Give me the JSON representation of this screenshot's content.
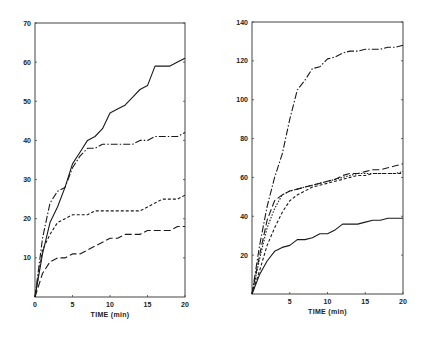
{
  "chart_data": [
    {
      "type": "line",
      "title": "",
      "xlabel": "TIME (min)",
      "ylabel": "",
      "xlim": [
        0,
        20
      ],
      "ylim": [
        0,
        70
      ],
      "x_ticks": [
        0,
        5,
        10,
        15,
        20
      ],
      "x_tick_labels": [
        "0",
        "5",
        "10",
        "15",
        "20"
      ],
      "y_ticks": [
        10,
        20,
        30,
        40,
        50,
        60,
        70
      ],
      "y_tick_labels": [
        "10",
        "20",
        "30",
        "40",
        "50",
        "60",
        "70"
      ],
      "grid": false,
      "legend": null,
      "series": [
        {
          "name": "solid",
          "style": "solid",
          "x": [
            0,
            1,
            2,
            3,
            4,
            5,
            6,
            7,
            8,
            9,
            10,
            11,
            12,
            13,
            14,
            15,
            16,
            17,
            18,
            19,
            20
          ],
          "y": [
            0,
            11,
            19,
            23,
            28,
            34,
            37,
            40,
            41,
            43,
            47,
            48,
            49,
            51,
            53,
            54,
            59,
            59,
            59,
            60,
            61
          ]
        },
        {
          "name": "dash-dot",
          "style": "dashdot",
          "x": [
            0,
            1,
            2,
            3,
            4,
            5,
            6,
            7,
            8,
            9,
            10,
            11,
            12,
            13,
            14,
            15,
            16,
            17,
            18,
            19,
            20
          ],
          "y": [
            0,
            15,
            24,
            27,
            28,
            33,
            36,
            38,
            38,
            39,
            39,
            39,
            39,
            39,
            40,
            40,
            41,
            41,
            41,
            41,
            42
          ]
        },
        {
          "name": "short-dash",
          "style": "shortdash",
          "x": [
            0,
            1,
            2,
            3,
            4,
            5,
            6,
            7,
            8,
            9,
            10,
            11,
            12,
            13,
            14,
            15,
            16,
            17,
            18,
            19,
            20
          ],
          "y": [
            0,
            12,
            16,
            19,
            20,
            21,
            21,
            21,
            22,
            22,
            22,
            22,
            22,
            22,
            22,
            23,
            24,
            25,
            25,
            25,
            26
          ]
        },
        {
          "name": "long-dash",
          "style": "longdash",
          "x": [
            0,
            1,
            2,
            3,
            4,
            5,
            6,
            7,
            8,
            9,
            10,
            11,
            12,
            13,
            14,
            15,
            16,
            17,
            18,
            19,
            20
          ],
          "y": [
            0,
            6,
            9,
            10,
            10,
            11,
            11,
            12,
            13,
            14,
            15,
            15,
            16,
            16,
            16,
            17,
            17,
            17,
            17,
            18,
            18
          ]
        }
      ]
    },
    {
      "type": "line",
      "title": "",
      "xlabel": "TIME (min)",
      "ylabel": "",
      "xlim": [
        0,
        20
      ],
      "ylim": [
        0,
        140
      ],
      "x_ticks": [
        5,
        10,
        15,
        20
      ],
      "x_tick_labels": [
        "5",
        "10",
        "15",
        "20"
      ],
      "y_ticks": [
        20,
        40,
        60,
        80,
        100,
        120,
        140
      ],
      "y_tick_labels": [
        "20",
        "40",
        "60",
        "80",
        "100",
        "120",
        "140"
      ],
      "grid": false,
      "legend": null,
      "series": [
        {
          "name": "dash-dot",
          "style": "dashdot",
          "x": [
            0,
            1,
            2,
            3,
            4,
            5,
            6,
            7,
            8,
            9,
            10,
            11,
            12,
            13,
            14,
            15,
            16,
            17,
            18,
            19,
            20
          ],
          "y": [
            0,
            25,
            45,
            60,
            72,
            90,
            105,
            110,
            116,
            117,
            121,
            122,
            124,
            125,
            125,
            126,
            126,
            126,
            127,
            127,
            128
          ]
        },
        {
          "name": "long-dash",
          "style": "longdash",
          "x": [
            0,
            1,
            2,
            3,
            4,
            5,
            6,
            7,
            8,
            9,
            10,
            11,
            12,
            13,
            14,
            15,
            16,
            17,
            18,
            19,
            20
          ],
          "y": [
            0,
            20,
            38,
            48,
            51,
            53,
            54,
            55,
            56,
            57,
            58,
            59,
            61,
            62,
            62,
            63,
            64,
            64,
            65,
            66,
            67
          ]
        },
        {
          "name": "dotted",
          "style": "dotted",
          "x": [
            0,
            1,
            2,
            3,
            4,
            5,
            6,
            7,
            8,
            9,
            10,
            11,
            12,
            13,
            14,
            15,
            16,
            17,
            18,
            19,
            20
          ],
          "y": [
            0,
            18,
            34,
            44,
            51,
            53,
            54,
            55,
            56,
            57,
            58,
            59,
            60,
            61,
            62,
            62,
            62,
            62,
            62,
            62,
            63
          ]
        },
        {
          "name": "short-dash",
          "style": "shortdash",
          "x": [
            0,
            1,
            2,
            3,
            4,
            5,
            6,
            7,
            8,
            9,
            10,
            11,
            12,
            13,
            14,
            15,
            16,
            17,
            18,
            19,
            20
          ],
          "y": [
            0,
            12,
            25,
            34,
            42,
            48,
            51,
            53,
            55,
            56,
            57,
            58,
            59,
            60,
            61,
            61,
            62,
            62,
            62,
            62,
            62
          ]
        },
        {
          "name": "solid",
          "style": "solid",
          "x": [
            0,
            1,
            2,
            3,
            4,
            5,
            6,
            7,
            8,
            9,
            10,
            11,
            12,
            13,
            14,
            15,
            16,
            17,
            18,
            19,
            20
          ],
          "y": [
            0,
            10,
            17,
            22,
            24,
            25,
            28,
            28,
            29,
            31,
            31,
            33,
            36,
            36,
            36,
            37,
            38,
            38,
            39,
            39,
            39
          ]
        }
      ]
    }
  ]
}
